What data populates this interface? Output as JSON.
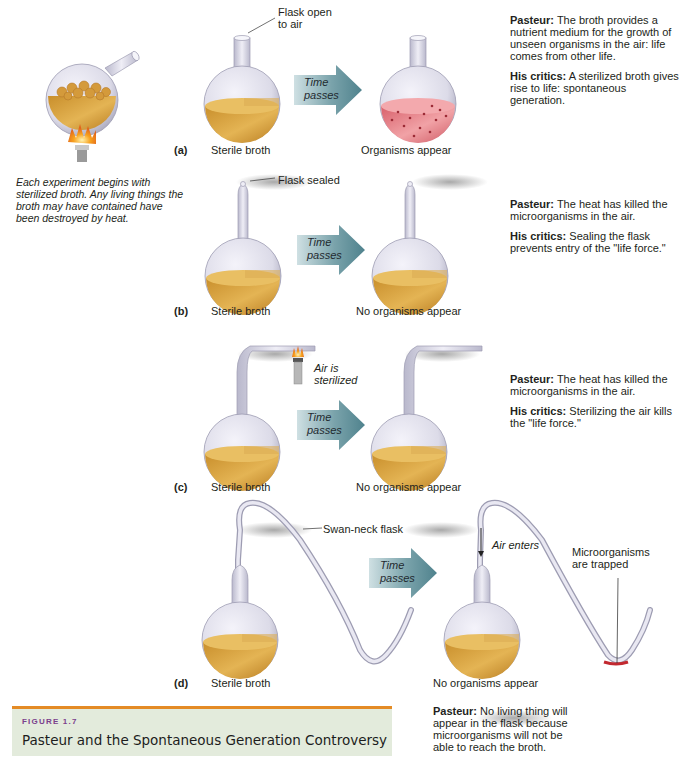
{
  "figure": {
    "number_label": "FIGURE 1.7",
    "title": "Pasteur and the Spontaneous Generation Controversy",
    "colors": {
      "caption_band": "#e3ebdc",
      "caption_rule": "#e48b25",
      "figure_number": "#7b3f8c",
      "broth": "#d9a644",
      "contaminated_broth": "#e07a80",
      "arrow": "#5f8f9a",
      "flame": "#f39a1c"
    }
  },
  "intro": {
    "text": "Each experiment begins with sterilized broth. Any living things the broth may have contained have been destroyed by heat."
  },
  "arrow_label": "Time passes",
  "arrow_line1": "Time",
  "arrow_line2": "passes",
  "panels": [
    {
      "letter": "(a)",
      "callout_line1": "Flask open",
      "callout_line2": "to air",
      "left_caption": "Sterile broth",
      "right_caption": "Organisms appear",
      "pasteur_label": "Pasteur:",
      "pasteur_text": " The broth provides a nutrient medium for the growth of unseen organisms in the air: life comes from other life.",
      "critics_label": "His critics:",
      "critics_text": " A sterilized broth gives rise to life: spontaneous generation."
    },
    {
      "letter": "(b)",
      "callout": "Flask sealed",
      "left_caption": "Sterile broth",
      "right_caption": "No organisms appear",
      "pasteur_label": "Pasteur:",
      "pasteur_text": " The heat has killed the microorganisms in the air.",
      "critics_label": "His critics:",
      "critics_text": " Sealing the flask prevents entry of the \"life force.\""
    },
    {
      "letter": "(c)",
      "callout_line1": "Air is",
      "callout_line2": "sterilized",
      "left_caption": "Sterile broth",
      "right_caption": "No organisms appear",
      "pasteur_label": "Pasteur:",
      "pasteur_text": " The heat has killed the microorganisms in the air.",
      "critics_label": "His critics:",
      "critics_text": " Sterilizing the air kills the \"life force.\""
    },
    {
      "letter": "(d)",
      "callout": "Swan-neck flask",
      "air_label": "Air enters",
      "trap_line1": "Microorganisms",
      "trap_line2": "are trapped",
      "left_caption": "Sterile broth",
      "right_caption": "No organisms appear",
      "pasteur_label": "Pasteur:",
      "pasteur_text": " No living thing will appear in the flask because microorganisms will not be able to reach the broth."
    }
  ]
}
